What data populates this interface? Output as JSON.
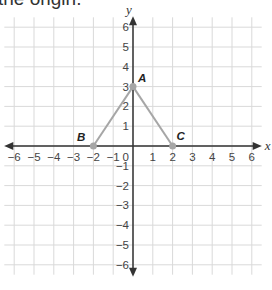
{
  "caption": "the origin.",
  "graph": {
    "x_axis_label": "x",
    "y_axis_label": "y",
    "x_range": [
      -6,
      6
    ],
    "y_range": [
      -6,
      6
    ],
    "x_ticks": [
      "-6",
      "-5",
      "-4",
      "-3",
      "-2",
      "-1",
      "1",
      "2",
      "3",
      "4",
      "5",
      "6"
    ],
    "y_ticks": [
      "6",
      "5",
      "4",
      "3",
      "2",
      "1",
      "-1",
      "-2",
      "-3",
      "-4",
      "-5",
      "-6"
    ],
    "origin_label": "0",
    "points": [
      {
        "label": "A",
        "x": 0,
        "y": 3
      },
      {
        "label": "B",
        "x": -2,
        "y": 0
      },
      {
        "label": "C",
        "x": 2,
        "y": 0
      }
    ],
    "segments": [
      [
        "B",
        "A"
      ],
      [
        "A",
        "C"
      ]
    ],
    "colors": {
      "grid": "#d9d9d9",
      "axis": "#333333",
      "segment": "#a6a6a6",
      "point": "#a6a6a6"
    }
  }
}
